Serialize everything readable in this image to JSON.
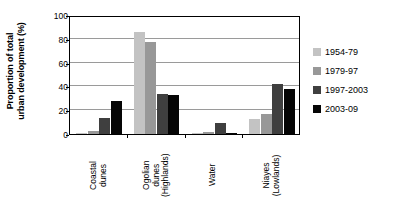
{
  "chart_data": {
    "type": "bar",
    "title": "",
    "xlabel": "",
    "ylabel": "Proportion of total urban development (%)",
    "ylabel_lines": [
      "Proportion of total",
      "urban development (%)"
    ],
    "ylim": [
      0,
      100
    ],
    "yticks": [
      100,
      80,
      60,
      40,
      20,
      0
    ],
    "grid": true,
    "legend_position": "right",
    "categories": [
      "Coastal dunes",
      "Ogolian dunes (Highlands)",
      "Water",
      "Niayes (Lowlands)"
    ],
    "category_lines": [
      [
        "Coastal",
        "dunes"
      ],
      [
        "Ogolian",
        "dunes",
        "(Highlands)"
      ],
      [
        "Water"
      ],
      [
        "Niayes",
        "(Lowlands)"
      ]
    ],
    "series": [
      {
        "name": "1954-79",
        "color": "#c3c3c3",
        "values": [
          0.5,
          86,
          0.3,
          13
        ]
      },
      {
        "name": "1979-97",
        "color": "#989898",
        "values": [
          2.5,
          77,
          2,
          17
        ]
      },
      {
        "name": "1997-2003",
        "color": "#3f3f3f",
        "values": [
          13.5,
          34,
          9,
          42
        ]
      },
      {
        "name": "2003-09",
        "color": "#050505",
        "values": [
          27.5,
          32.5,
          1,
          37.5
        ]
      }
    ]
  },
  "legend": {
    "items": [
      {
        "label": "1954-79"
      },
      {
        "label": "1979-97"
      },
      {
        "label": "1997-2003"
      },
      {
        "label": "2003-09"
      }
    ]
  }
}
